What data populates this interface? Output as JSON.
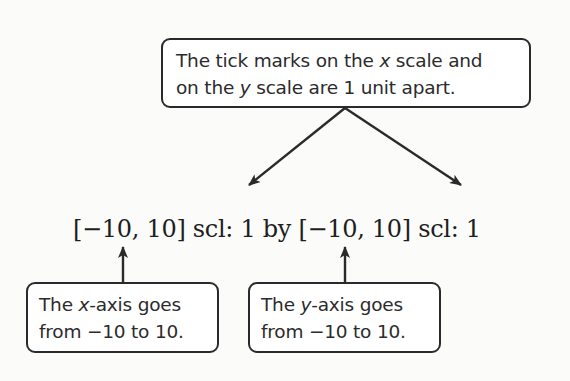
{
  "top_callout": {
    "line1_pre": "The tick marks on the ",
    "line1_var": "x",
    "line1_post": " scale and",
    "line2_pre": "on the ",
    "line2_var": "y",
    "line2_post": " scale are 1 unit apart."
  },
  "window_notation": {
    "text": "[−10, 10] scl: 1 by [−10, 10] scl: 1",
    "x_range": {
      "min": -10,
      "max": 10,
      "scl": 1
    },
    "y_range": {
      "min": -10,
      "max": 10,
      "scl": 1
    }
  },
  "left_callout": {
    "line1_pre": "The ",
    "line1_var": "x",
    "line1_post": "-axis goes",
    "line2": "from −10 to 10."
  },
  "right_callout": {
    "line1_pre": "The ",
    "line1_var": "y",
    "line1_post": "-axis goes",
    "line2": "from −10 to 10."
  },
  "colors": {
    "stroke": "#2a2a2a",
    "text": "#2b2b2b",
    "background": "#fbfbfa"
  }
}
